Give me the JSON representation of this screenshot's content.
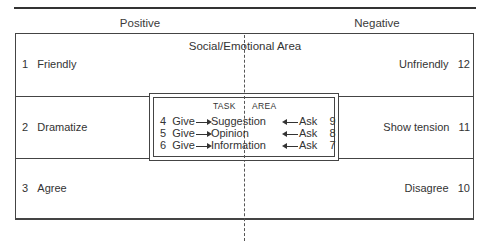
{
  "header": {
    "positive_label": "Positive",
    "negative_label": "Negative"
  },
  "social_emotional_area": {
    "title": "Social/Emotional Area",
    "positive": [
      {
        "num": "1",
        "label": "Friendly"
      },
      {
        "num": "2",
        "label": "Dramatize"
      },
      {
        "num": "3",
        "label": "Agree"
      }
    ],
    "negative": [
      {
        "num": "12",
        "label": "Unfriendly"
      },
      {
        "num": "11",
        "label": "Show tension"
      },
      {
        "num": "10",
        "label": "Disagree"
      }
    ]
  },
  "task_area": {
    "title_left": "TASK",
    "title_right": "AREA",
    "rows": [
      {
        "give_num": "4",
        "give": "Give",
        "topic": "Suggestion",
        "ask": "Ask",
        "ask_num": "9"
      },
      {
        "give_num": "5",
        "give": "Give",
        "topic": "Opinion",
        "ask": "Ask",
        "ask_num": "8"
      },
      {
        "give_num": "6",
        "give": "Give",
        "topic": "Information",
        "ask": "Ask",
        "ask_num": "7"
      }
    ]
  }
}
